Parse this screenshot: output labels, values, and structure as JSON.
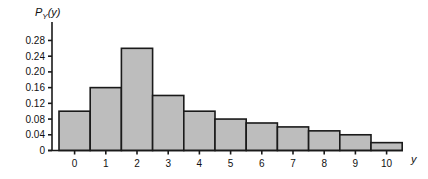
{
  "chart_data": {
    "type": "bar",
    "title": "",
    "ylabel": "P_Y(y)",
    "xlabel": "y",
    "categories": [
      "0",
      "1",
      "2",
      "3",
      "4",
      "5",
      "6",
      "7",
      "8",
      "9",
      "10"
    ],
    "values": [
      0.1,
      0.16,
      0.26,
      0.14,
      0.1,
      0.08,
      0.07,
      0.06,
      0.05,
      0.04,
      0.02
    ],
    "yticks": [
      "0",
      "0.04",
      "0.08",
      "0.12",
      "0.16",
      "0.20",
      "0.24",
      "0.28"
    ],
    "ylim": [
      0,
      0.3
    ],
    "grid": false,
    "legend": null,
    "bar_color": "#bdbdbd",
    "edge_color": "#1a1a1a"
  },
  "labels": {
    "y_axis_main": "P",
    "y_axis_sub": "Y",
    "y_axis_arg": "(y)",
    "x_axis": "y"
  }
}
